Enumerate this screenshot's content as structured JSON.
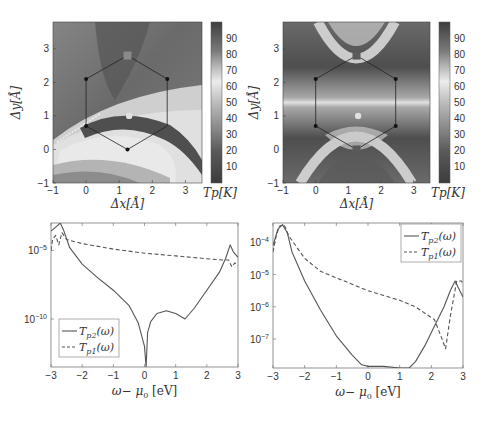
{
  "figure": {
    "panels": [
      "heatmap-left",
      "heatmap-right",
      "line-left",
      "line-right"
    ]
  },
  "chart_data": [
    {
      "id": "heatmap-left",
      "type": "heatmap",
      "title": "",
      "xlabel": "Δx[Å]",
      "ylabel": "Δy[Å]",
      "xlim": [
        -1,
        3.5
      ],
      "ylim": [
        -1,
        3.8
      ],
      "xticks": [
        "-1",
        "0",
        "1",
        "2",
        "3"
      ],
      "yticks": [
        "-1",
        "0",
        "1",
        "2",
        "3"
      ],
      "colorbar": {
        "label": "Tp[K]",
        "ticks": [
          "10",
          "20",
          "30",
          "40",
          "50",
          "60",
          "70",
          "80",
          "90"
        ],
        "range": [
          0,
          100
        ],
        "description": "grayscale: dark at 0 and at ~95, lightest near 60-65"
      },
      "hexagon_vertices": [
        [
          1.25,
          2.8
        ],
        [
          2.45,
          2.1
        ],
        [
          2.45,
          0.7
        ],
        [
          1.25,
          0.0
        ],
        [
          0.0,
          0.7
        ],
        [
          0.0,
          2.1
        ]
      ],
      "markers": [
        {
          "type": "square",
          "x": 1.25,
          "y": 2.8,
          "color": "#8a8a8a"
        },
        {
          "type": "circle",
          "x": 1.3,
          "y": 1.0,
          "color": "#e0e0e0"
        },
        {
          "type": "dot",
          "x": 0.0,
          "y": 2.1
        },
        {
          "type": "dot",
          "x": 2.45,
          "y": 2.1
        },
        {
          "type": "dot",
          "x": 0.0,
          "y": 0.7
        },
        {
          "type": "dot",
          "x": 1.25,
          "y": 0.0
        }
      ]
    },
    {
      "id": "heatmap-right",
      "type": "heatmap",
      "title": "",
      "xlabel": "Δx[Å]",
      "ylabel": "Δy[Å]",
      "xlim": [
        -1,
        3.5
      ],
      "ylim": [
        -1,
        3.8
      ],
      "xticks": [
        "-1",
        "0",
        "1",
        "2",
        "3"
      ],
      "yticks": [
        "-1",
        "0",
        "1",
        "2",
        "3"
      ],
      "colorbar": {
        "label": "Tp[K]",
        "ticks": [
          "10",
          "20",
          "30",
          "40",
          "50",
          "60",
          "70",
          "80",
          "90"
        ],
        "range": [
          0,
          100
        ]
      },
      "hexagon_vertices": [
        [
          1.25,
          2.8
        ],
        [
          2.45,
          2.1
        ],
        [
          2.45,
          0.7
        ],
        [
          1.25,
          0.0
        ],
        [
          0.0,
          0.7
        ],
        [
          0.0,
          2.1
        ]
      ],
      "markers": [
        {
          "type": "square",
          "x": 1.25,
          "y": 2.8,
          "color": "#5a5a5a"
        },
        {
          "type": "square",
          "x": 1.25,
          "y": 0.0,
          "color": "#5a5a5a"
        },
        {
          "type": "circle",
          "x": 1.3,
          "y": 1.0,
          "color": "#e0e0e0"
        },
        {
          "type": "dot",
          "x": 0.0,
          "y": 2.1
        },
        {
          "type": "dot",
          "x": 2.45,
          "y": 2.1
        },
        {
          "type": "dot",
          "x": 0.0,
          "y": 0.7
        },
        {
          "type": "dot",
          "x": 2.45,
          "y": 0.7
        }
      ]
    },
    {
      "id": "line-left",
      "type": "line",
      "title": "",
      "xlabel": "ω− μ0 [eV]",
      "ylabel": "",
      "yscale": "log",
      "xlim": [
        -3,
        3
      ],
      "ylim_log10": [
        -13.5,
        -3.0
      ],
      "xticks": [
        "-3",
        "-2",
        "-1",
        "0",
        "1",
        "2",
        "3"
      ],
      "yticks": [
        {
          "label": "10",
          "exp": "-5",
          "log10": -5
        },
        {
          "label": "10",
          "exp": "-10",
          "log10": -10
        }
      ],
      "legend": {
        "position": "lower-left",
        "entries": [
          "T_p2(ω)",
          "T_p1(ω)"
        ]
      },
      "series": [
        {
          "name": "T_p2(ω)",
          "style": "solid",
          "x": [
            -3.0,
            -2.85,
            -2.7,
            -2.6,
            -2.4,
            -2.0,
            -1.5,
            -1.0,
            -0.5,
            -0.2,
            0.0,
            0.05,
            0.1,
            0.2,
            0.4,
            0.7,
            1.0,
            1.3,
            1.6,
            2.0,
            2.4,
            2.6,
            2.75,
            2.85,
            3.0
          ],
          "log10y": [
            -3.6,
            -3.3,
            -3.0,
            -3.5,
            -4.8,
            -6.0,
            -7.0,
            -7.9,
            -9.0,
            -10.3,
            -12.0,
            -13.5,
            -11.0,
            -10.2,
            -9.6,
            -9.4,
            -9.6,
            -10.0,
            -9.2,
            -7.9,
            -6.6,
            -5.6,
            -4.6,
            -5.1,
            -5.5
          ]
        },
        {
          "name": "T_p1(ω)",
          "style": "dashed",
          "x": [
            -3.0,
            -2.95,
            -2.85,
            -2.75,
            -2.65,
            -2.5,
            -2.0,
            -1.0,
            0.0,
            1.0,
            2.0,
            2.5,
            2.7,
            2.8,
            2.9,
            3.0
          ],
          "log10y": [
            -5.0,
            -4.2,
            -3.9,
            -4.6,
            -3.7,
            -4.2,
            -4.5,
            -4.9,
            -5.2,
            -5.4,
            -5.6,
            -5.7,
            -5.7,
            -6.2,
            -5.9,
            -6.1
          ]
        }
      ]
    },
    {
      "id": "line-right",
      "type": "line",
      "title": "",
      "xlabel": "ω− μ0 [eV]",
      "ylabel": "",
      "yscale": "log",
      "xlim": [
        -3,
        3
      ],
      "ylim_log10": [
        -7.9,
        -3.4
      ],
      "xticks": [
        "-3",
        "-2",
        "-1",
        "0",
        "1",
        "2",
        "3"
      ],
      "yticks": [
        {
          "label": "10",
          "exp": "-4",
          "log10": -4
        },
        {
          "label": "10",
          "exp": "-5",
          "log10": -5
        },
        {
          "label": "10",
          "exp": "-6",
          "log10": -6
        },
        {
          "label": "10",
          "exp": "-7",
          "log10": -7
        }
      ],
      "legend": {
        "position": "upper-right",
        "entries": [
          "T_p2(ω)",
          "T_p1(ω)"
        ]
      },
      "series": [
        {
          "name": "T_p2(ω)",
          "style": "solid",
          "x": [
            -3.0,
            -2.85,
            -2.7,
            -2.55,
            -2.4,
            -2.0,
            -1.5,
            -1.0,
            -0.5,
            -0.2,
            0.0,
            0.5,
            1.0,
            1.3,
            1.5,
            1.8,
            2.1,
            2.4,
            2.6,
            2.75,
            2.9,
            3.0
          ],
          "log10y": [
            -4.1,
            -3.6,
            -3.45,
            -3.7,
            -4.3,
            -5.2,
            -6.1,
            -6.9,
            -7.5,
            -7.8,
            -7.85,
            -7.85,
            -7.9,
            -7.9,
            -7.7,
            -7.2,
            -6.6,
            -6.0,
            -5.5,
            -5.2,
            -5.5,
            -5.7
          ]
        },
        {
          "name": "T_p1(ω)",
          "style": "dashed",
          "x": [
            -3.0,
            -2.9,
            -2.8,
            -2.65,
            -2.5,
            -2.0,
            -1.5,
            -1.0,
            -0.5,
            0.0,
            0.5,
            1.0,
            1.5,
            1.8,
            2.1,
            2.3,
            2.45,
            2.6,
            2.8,
            2.95,
            3.0
          ],
          "log10y": [
            -4.3,
            -3.8,
            -3.5,
            -3.45,
            -3.8,
            -4.5,
            -4.9,
            -5.1,
            -5.3,
            -5.5,
            -5.65,
            -5.8,
            -6.0,
            -6.2,
            -6.4,
            -6.9,
            -7.3,
            -6.3,
            -5.2,
            -5.2,
            -5.3
          ]
        }
      ]
    }
  ]
}
